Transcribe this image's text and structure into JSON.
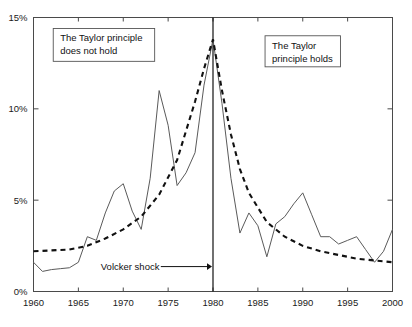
{
  "chart_data": {
    "type": "line",
    "title": "",
    "xlabel": "",
    "ylabel": "",
    "xlim": [
      1960,
      2000
    ],
    "ylim": [
      0,
      15
    ],
    "grid": false,
    "legend_position": "none",
    "y_tick_labels": [
      "0%",
      "5%",
      "10%",
      "15%"
    ],
    "y_ticks": [
      0,
      5,
      10,
      15
    ],
    "x_tick_labels": [
      "1960",
      "1965",
      "1970",
      "1975",
      "1980",
      "1985",
      "1990",
      "1995",
      "2000"
    ],
    "x_ticks": [
      1960,
      1965,
      1970,
      1975,
      1980,
      1985,
      1990,
      1995,
      2000
    ],
    "series": [
      {
        "name": "inflation-actual",
        "style": "solid",
        "color": "#5a5a5a",
        "x": [
          1960,
          1961,
          1962,
          1963,
          1964,
          1965,
          1966,
          1967,
          1968,
          1969,
          1970,
          1971,
          1972,
          1973,
          1974,
          1975,
          1976,
          1977,
          1978,
          1979,
          1980,
          1981,
          1982,
          1983,
          1984,
          1985,
          1986,
          1987,
          1988,
          1989,
          1990,
          1991,
          1992,
          1993,
          1994,
          1995,
          1996,
          1997,
          1998,
          1999,
          2000
        ],
        "values": [
          1.6,
          1.1,
          1.2,
          1.25,
          1.3,
          1.6,
          3.0,
          2.8,
          4.3,
          5.5,
          5.9,
          4.4,
          3.4,
          6.2,
          11.0,
          9.1,
          5.8,
          6.5,
          7.6,
          11.3,
          13.8,
          10.3,
          6.2,
          3.2,
          4.3,
          3.6,
          1.9,
          3.7,
          4.1,
          4.8,
          5.4,
          4.2,
          3.0,
          3.0,
          2.6,
          2.8,
          3.0,
          2.3,
          1.6,
          2.2,
          3.4
        ]
      },
      {
        "name": "trend-fitted",
        "style": "dashed",
        "color": "#111111",
        "x": [
          1960,
          1962,
          1964,
          1966,
          1968,
          1970,
          1972,
          1974,
          1976,
          1978,
          1979,
          1980,
          1981,
          1982,
          1983,
          1984,
          1986,
          1988,
          1990,
          1992,
          1994,
          1996,
          1998,
          2000
        ],
        "values": [
          2.2,
          2.25,
          2.3,
          2.5,
          2.9,
          3.4,
          4.1,
          5.3,
          7.2,
          10.4,
          12.2,
          13.8,
          11.0,
          8.6,
          6.7,
          5.4,
          3.8,
          3.0,
          2.5,
          2.2,
          2.0,
          1.8,
          1.7,
          1.6
        ]
      }
    ],
    "vertical_marker": {
      "name": "volcker-shock-line",
      "x": 1980,
      "label": "Volcker shock"
    },
    "annotations": [
      {
        "name": "taylor-principle-does-not-hold",
        "lines": [
          "The Taylor principle",
          "does not hold"
        ],
        "x_range": [
          1962.2,
          1973.5
        ],
        "y_range": [
          12.6,
          14.4
        ]
      },
      {
        "name": "taylor-principle-holds",
        "lines": [
          "The Taylor",
          "principle holds"
        ],
        "x_range": [
          1985.8,
          1994.2
        ],
        "y_range": [
          12.3,
          14.0
        ]
      },
      {
        "name": "volcker-shock-callout",
        "lines": [
          "Volcker shock"
        ],
        "x_range": [
          1967.5,
          1979.6
        ],
        "y_range": [
          1.2,
          1.2
        ]
      }
    ],
    "colors": {
      "solid_series": "#5a5a5a",
      "dashed_series": "#111111",
      "axis": "#4a4a4a",
      "background": "#ffffff",
      "text": "#111111"
    }
  }
}
